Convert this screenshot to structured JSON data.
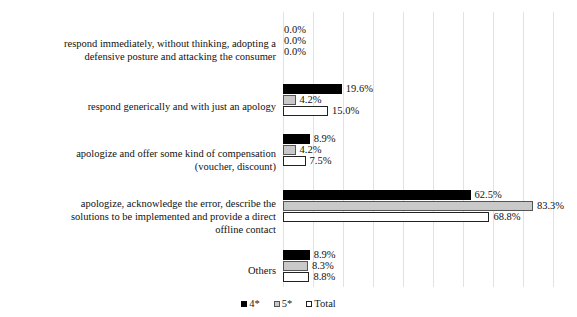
{
  "chart_data": {
    "type": "bar",
    "orientation": "horizontal",
    "title": "",
    "subtitle": "",
    "xlabel": "",
    "ylabel": "",
    "xlim": [
      0,
      100
    ],
    "grid": true,
    "gridlines_percent": [
      0,
      10,
      20,
      30,
      40,
      50,
      60,
      70,
      80,
      90,
      100
    ],
    "legend_position": "bottom",
    "value_suffix": "%",
    "categories": [
      "respond immediately, without thinking, adopting a defensive posture and attacking the consumer",
      "respond generically and with just an apology",
      "apologize and offer some kind of compensation (voucher, discount)",
      "apologize, acknowledge the error, describe the solutions to be implemented and provide a direct offline contact",
      "Others"
    ],
    "series": [
      {
        "name": "4*",
        "color": "#000000",
        "values": [
          0.0,
          19.6,
          8.9,
          62.5,
          8.9
        ],
        "labels": [
          "0.0%",
          "19.6%",
          "8.9%",
          "62.5%",
          "8.9%"
        ]
      },
      {
        "name": "5*",
        "color": "#c9c9c9",
        "values": [
          0.0,
          4.2,
          4.2,
          83.3,
          8.3
        ],
        "labels": [
          "0.0%",
          "4.2%",
          "4.2%",
          "83.3%",
          "8.3%"
        ]
      },
      {
        "name": "Total",
        "color": "#ffffff",
        "values": [
          0.0,
          15.0,
          7.5,
          68.8,
          8.8
        ],
        "labels": [
          "0.0%",
          "15.0%",
          "7.5%",
          "68.8%",
          "8.8%"
        ]
      }
    ]
  },
  "legend": {
    "items": [
      {
        "label": "4*"
      },
      {
        "label": "5*"
      },
      {
        "label": "Total"
      }
    ]
  },
  "categories_display": [
    {
      "lines": [
        "respond immediately, without thinking, adopting a",
        "defensive posture and attacking the consumer"
      ]
    },
    {
      "lines": [
        "respond generically and with just an apology"
      ]
    },
    {
      "lines": [
        "apologize and offer some kind of compensation",
        "(voucher, discount)"
      ]
    },
    {
      "lines": [
        "apologize, acknowledge the error, describe the",
        "solutions to be implemented and provide a direct",
        "offline contact"
      ]
    },
    {
      "lines": [
        "Others"
      ]
    }
  ]
}
